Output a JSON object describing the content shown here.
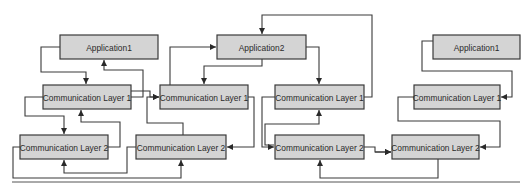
{
  "diagram": {
    "title": "",
    "nodes": [
      {
        "id": "app1_left",
        "label": "Application1",
        "x": 60,
        "y": 35,
        "w": 98,
        "h": 24
      },
      {
        "id": "cl1_a",
        "label": "Communication Layer 1",
        "x": 43,
        "y": 85,
        "w": 88,
        "h": 24
      },
      {
        "id": "cl2_a",
        "label": "Communication Layer 2",
        "x": 20,
        "y": 135,
        "w": 88,
        "h": 24
      },
      {
        "id": "app2",
        "label": "Application2",
        "x": 217,
        "y": 35,
        "w": 89,
        "h": 24
      },
      {
        "id": "cl1_b",
        "label": "Communication Layer 1",
        "x": 160,
        "y": 85,
        "w": 88,
        "h": 24
      },
      {
        "id": "cl2_b",
        "label": "Communication Layer 2",
        "x": 136,
        "y": 135,
        "w": 90,
        "h": 24
      },
      {
        "id": "cl1_c",
        "label": "Communication Layer 1",
        "x": 275,
        "y": 85,
        "w": 89,
        "h": 24
      },
      {
        "id": "cl2_c",
        "label": "Communication Layer 2",
        "x": 275,
        "y": 135,
        "w": 89,
        "h": 24
      },
      {
        "id": "app1_right",
        "label": "Application1",
        "x": 433,
        "y": 35,
        "w": 87,
        "h": 24
      },
      {
        "id": "cl1_d",
        "label": "Communication Layer 1",
        "x": 414,
        "y": 85,
        "w": 86,
        "h": 24
      },
      {
        "id": "cl2_d",
        "label": "Communication Layer 2",
        "x": 392,
        "y": 135,
        "w": 87,
        "h": 24
      }
    ],
    "edges": [
      {
        "from": "app1_left",
        "to": "cl1_a",
        "points": [
          [
            60,
            47
          ],
          [
            41,
            47
          ],
          [
            41,
            72
          ],
          [
            86,
            72
          ],
          [
            86,
            84
          ]
        ]
      },
      {
        "from": "cl1_a",
        "to": "app1_left",
        "points": [
          [
            131,
            97
          ],
          [
            143,
            97
          ],
          [
            143,
            70
          ],
          [
            104,
            70
          ],
          [
            104,
            60
          ]
        ]
      },
      {
        "from": "cl1_a",
        "to": "cl2_a",
        "points": [
          [
            43,
            97
          ],
          [
            25,
            97
          ],
          [
            25,
            116
          ],
          [
            64,
            116
          ],
          [
            64,
            134
          ]
        ]
      },
      {
        "from": "cl2_a",
        "to": "cl1_a",
        "points": [
          [
            108,
            147
          ],
          [
            120,
            147
          ],
          [
            120,
            122
          ],
          [
            81,
            122
          ],
          [
            81,
            110
          ]
        ]
      },
      {
        "from": "cl2_a",
        "to": "cl2_b",
        "points": [
          [
            20,
            147
          ],
          [
            13,
            147
          ],
          [
            13,
            178
          ],
          [
            181,
            178
          ],
          [
            181,
            160
          ]
        ]
      },
      {
        "from": "cl2_b",
        "to": "cl2_a",
        "points": [
          [
            136,
            147
          ],
          [
            127,
            147
          ],
          [
            127,
            173
          ],
          [
            64,
            173
          ],
          [
            64,
            160
          ]
        ]
      },
      {
        "from": "cl1_a",
        "to": "cl1_b",
        "points": [
          [
            131,
            91
          ],
          [
            150,
            91
          ],
          [
            150,
            97
          ],
          [
            159,
            97
          ]
        ]
      },
      {
        "from": "cl2_b",
        "to": "cl1_b",
        "points": [
          [
            183,
            135
          ],
          [
            183,
            123
          ],
          [
            147,
            123
          ],
          [
            147,
            97
          ],
          [
            159,
            97
          ]
        ]
      },
      {
        "from": "cl1_b",
        "to": "app2",
        "points": [
          [
            160,
            97
          ],
          [
            170,
            97
          ],
          [
            170,
            47
          ],
          [
            216,
            47
          ]
        ]
      },
      {
        "from": "app2",
        "to": "cl1_b",
        "points": [
          [
            262,
            59
          ],
          [
            262,
            66
          ],
          [
            204,
            66
          ],
          [
            204,
            84
          ]
        ]
      },
      {
        "from": "cl1_b",
        "to": "cl2_b",
        "points": [
          [
            248,
            97
          ],
          [
            254,
            97
          ],
          [
            254,
            147
          ],
          [
            227,
            147
          ]
        ]
      },
      {
        "from": "app2",
        "to": "cl1_c",
        "points": [
          [
            306,
            47
          ],
          [
            319,
            47
          ],
          [
            319,
            84
          ]
        ]
      },
      {
        "from": "cl1_c",
        "to": "app2",
        "points": [
          [
            364,
            97
          ],
          [
            372,
            97
          ],
          [
            372,
            15
          ],
          [
            262,
            15
          ],
          [
            262,
            34
          ]
        ]
      },
      {
        "from": "cl1_c",
        "to": "cl2_c",
        "points": [
          [
            275,
            97
          ],
          [
            262,
            97
          ],
          [
            262,
            147
          ],
          [
            274,
            147
          ]
        ]
      },
      {
        "from": "cl2_c",
        "to": "cl1_c",
        "points": [
          [
            274,
            145
          ],
          [
            265,
            145
          ],
          [
            265,
            124
          ],
          [
            319,
            124
          ],
          [
            319,
            110
          ]
        ]
      },
      {
        "from": "cl2_c",
        "to": "cl2_d",
        "points": [
          [
            364,
            147
          ],
          [
            375,
            147
          ],
          [
            375,
            152
          ],
          [
            391,
            152
          ]
        ]
      },
      {
        "from": "cl2_d",
        "to": "cl2_c",
        "points": [
          [
            438,
            159
          ],
          [
            438,
            178
          ],
          [
            320,
            178
          ],
          [
            320,
            160
          ]
        ]
      },
      {
        "from": "app1_right",
        "to": "cl1_d",
        "points": [
          [
            433,
            41
          ],
          [
            422,
            41
          ],
          [
            422,
            71
          ],
          [
            512,
            71
          ],
          [
            512,
            97
          ],
          [
            501,
            97
          ]
        ]
      },
      {
        "from": "cl1_d",
        "to": "cl2_d",
        "points": [
          [
            414,
            97
          ],
          [
            398,
            97
          ],
          [
            398,
            121
          ],
          [
            500,
            121
          ],
          [
            500,
            147
          ],
          [
            480,
            147
          ]
        ]
      },
      {
        "from": "cl2_d",
        "to": "cl2_c_out",
        "points": [
          [
            375,
            152
          ],
          [
            391,
            152
          ]
        ]
      }
    ],
    "bottom_rule": {
      "x1": 12,
      "x2": 520,
      "y": 182
    }
  }
}
